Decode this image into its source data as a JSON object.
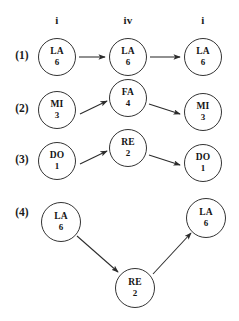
{
  "figure": {
    "title": "",
    "background_color": "#ffffff",
    "stroke_color": "#333333",
    "text_color": "#1a1a1a",
    "column_headers": [
      {
        "label": "i",
        "x": 57
      },
      {
        "label": "iv",
        "x": 128
      },
      {
        "label": "i",
        "x": 203
      }
    ],
    "row_labels": [
      {
        "label": "(1)",
        "x": 22,
        "y": 57
      },
      {
        "label": "(2)",
        "x": 22,
        "y": 110
      },
      {
        "label": "(3)",
        "x": 22,
        "y": 160
      },
      {
        "label": "(4)",
        "x": 22,
        "y": 214
      }
    ],
    "nodes": [
      {
        "id": "n1a",
        "syllable": "LA",
        "number": "6",
        "cx": 57,
        "cy": 57,
        "r": 19
      },
      {
        "id": "n1b",
        "syllable": "LA",
        "number": "6",
        "cx": 128,
        "cy": 57,
        "r": 19
      },
      {
        "id": "n1c",
        "syllable": "LA",
        "number": "6",
        "cx": 203,
        "cy": 57,
        "r": 19
      },
      {
        "id": "n2a",
        "syllable": "MI",
        "number": "3",
        "cx": 57,
        "cy": 110,
        "r": 19
      },
      {
        "id": "n2b",
        "syllable": "FA",
        "number": "4",
        "cx": 128,
        "cy": 98,
        "r": 19
      },
      {
        "id": "n2c",
        "syllable": "MI",
        "number": "3",
        "cx": 203,
        "cy": 112,
        "r": 19
      },
      {
        "id": "n3a",
        "syllable": "DO",
        "number": "1",
        "cx": 57,
        "cy": 161,
        "r": 19
      },
      {
        "id": "n3b",
        "syllable": "RE",
        "number": "2",
        "cx": 128,
        "cy": 148,
        "r": 19
      },
      {
        "id": "n3c",
        "syllable": "DO",
        "number": "1",
        "cx": 203,
        "cy": 163,
        "r": 19
      },
      {
        "id": "n4a",
        "syllable": "LA",
        "number": "6",
        "cx": 61,
        "cy": 222,
        "r": 20
      },
      {
        "id": "n4b",
        "syllable": "RE",
        "number": "2",
        "cx": 135,
        "cy": 288,
        "r": 20
      },
      {
        "id": "n4c",
        "syllable": "LA",
        "number": "6",
        "cx": 206,
        "cy": 218,
        "r": 20
      }
    ],
    "edges": [
      {
        "from": "n1a",
        "to": "n1b",
        "x1": 79,
        "y1": 57,
        "x2": 106,
        "y2": 57
      },
      {
        "from": "n1b",
        "to": "n1c",
        "x1": 150,
        "y1": 57,
        "x2": 181,
        "y2": 57
      },
      {
        "from": "n2a",
        "to": "n2b",
        "x1": 80,
        "y1": 113,
        "x2": 108,
        "y2": 100
      },
      {
        "from": "n2b",
        "to": "n2c",
        "x1": 149,
        "y1": 103,
        "x2": 180,
        "y2": 113
      },
      {
        "from": "n3a",
        "to": "n3b",
        "x1": 80,
        "y1": 163,
        "x2": 108,
        "y2": 150
      },
      {
        "from": "n3b",
        "to": "n3c",
        "x1": 149,
        "y1": 154,
        "x2": 180,
        "y2": 165
      },
      {
        "from": "n4a",
        "to": "n4b",
        "x1": 78,
        "y1": 236,
        "x2": 119,
        "y2": 273
      },
      {
        "from": "n4b",
        "to": "n4c",
        "x1": 152,
        "y1": 274,
        "x2": 190,
        "y2": 232
      }
    ]
  }
}
